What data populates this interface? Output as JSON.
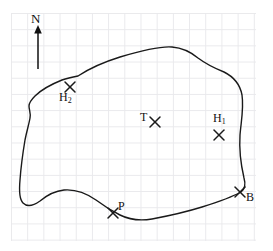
{
  "figure": {
    "kind": "hand-drawn-sketch-map",
    "background": "graph-paper",
    "grid": {
      "line_color": "#e9e9ec",
      "cell_size_px": 16.2,
      "left_px": 11,
      "top_px": 13,
      "width_px": 245,
      "height_px": 228,
      "columns": 15,
      "rows": 14
    },
    "outline": {
      "stroke_color": "#1a1a1a",
      "stroke_width_px": 1.4,
      "closed": true,
      "description": "irregular closed curve representing a field or lake boundary"
    },
    "compass": {
      "label": "N",
      "direction": "up",
      "arrow_x_px": 38,
      "arrow_tip_y_px": 26,
      "arrow_tail_y_px": 69,
      "color": "#111111"
    },
    "markers": [
      {
        "id": "T",
        "label": "T",
        "glyph": "x-mark",
        "x_px": 155,
        "y_px": 122,
        "label_x_px": 140,
        "label_y_px": 111,
        "position": "interior",
        "subscript": ""
      },
      {
        "id": "H2",
        "label": "H",
        "subscript": "2",
        "glyph": "x-mark",
        "x_px": 70,
        "y_px": 87,
        "label_x_px": 59,
        "label_y_px": 91,
        "position": "interior"
      },
      {
        "id": "H1",
        "label": "H",
        "subscript": "1",
        "glyph": "x-mark",
        "x_px": 219,
        "y_px": 135,
        "label_x_px": 213,
        "label_y_px": 112,
        "position": "interior"
      },
      {
        "id": "P",
        "label": "P",
        "subscript": "",
        "glyph": "x-mark",
        "x_px": 113,
        "y_px": 213,
        "label_x_px": 118,
        "label_y_px": 200,
        "position": "on-boundary"
      },
      {
        "id": "B",
        "label": "B",
        "subscript": "",
        "glyph": "x-mark",
        "x_px": 240,
        "y_px": 192,
        "label_x_px": 246,
        "label_y_px": 191,
        "position": "on-boundary"
      }
    ]
  }
}
